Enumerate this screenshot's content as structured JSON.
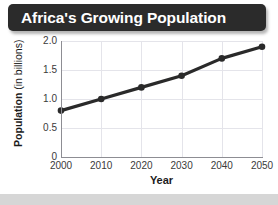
{
  "title": "Africa's Growing Population",
  "bottom_band": "",
  "axes": {
    "ylabel_bold": "Population",
    "ylabel_regular": " (in billions)",
    "xlabel": "Year"
  },
  "colors": {
    "banner": "#2b2b2b",
    "title_text": "#ffffff",
    "line": "#2a2a2a",
    "gridline": "#e4e4ea",
    "axis": "#8d8d93",
    "plot_background": "#ffffff",
    "bottom_band": "#d6d6d6"
  },
  "chart_data": {
    "type": "line",
    "title": "Africa's Growing Population",
    "xlabel": "Year",
    "ylabel": "Population (in billions)",
    "x": [
      2000,
      2010,
      2020,
      2030,
      2040,
      2050
    ],
    "values": [
      0.8,
      1.0,
      1.2,
      1.4,
      1.7,
      1.9
    ],
    "xticklabels": [
      "2000",
      "2010",
      "2020",
      "2030",
      "2040",
      "2050"
    ],
    "yticklabels": [
      "0",
      "0.5",
      "1.0",
      "1.5",
      "2.0"
    ],
    "yticks": [
      0,
      0.5,
      1.0,
      1.5,
      2.0
    ],
    "xlim": [
      2000,
      2050
    ],
    "ylim": [
      0,
      2.0
    ],
    "grid": true,
    "legend": false,
    "marker": "circle",
    "line_color": "#2a2a2a"
  }
}
